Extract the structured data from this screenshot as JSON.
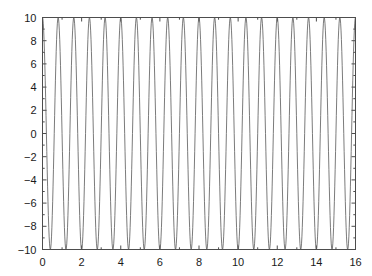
{
  "figure": {
    "background_color": "#ffffff",
    "axes_color": "#4d4d4d",
    "tick_label_color": "#1a1a1a"
  },
  "chart_data": {
    "type": "line",
    "title": "",
    "xlabel": "",
    "ylabel": "",
    "xlim": [
      0,
      16
    ],
    "ylim": [
      -10,
      10
    ],
    "xticks": [
      0,
      2,
      4,
      6,
      8,
      10,
      12,
      14,
      16
    ],
    "yticks": [
      10,
      8,
      6,
      4,
      2,
      0,
      -2,
      -4,
      -6,
      -8,
      -10
    ],
    "xticklabels": [
      "0",
      "2",
      "4",
      "6",
      "8",
      "10",
      "12",
      "14",
      "16"
    ],
    "yticklabels": [
      "10",
      "8",
      "6",
      "4",
      "2",
      "0",
      "-2",
      "-4",
      "-6",
      "-8",
      "-10"
    ],
    "grid": false,
    "legend": null,
    "minor_ticks": true,
    "box": true,
    "tick_direction": "in",
    "series": [
      {
        "name": "cosine",
        "color": "#595959",
        "linewidth": 0.8,
        "waveform": "cosine",
        "amplitude": 10,
        "period": 0.8,
        "frequency": 1.25,
        "phase_deg": 0,
        "offset": 0,
        "x_start": 0,
        "x_end": 16,
        "num_cycles": 20,
        "num_samples": 801,
        "description": "y = 10*cos(2*pi*x/0.8) sampled from x=0 to x=16"
      }
    ]
  }
}
